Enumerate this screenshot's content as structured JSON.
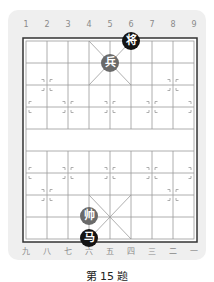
{
  "board": {
    "top_file_labels": [
      "1",
      "2",
      "3",
      "4",
      "5",
      "6",
      "7",
      "8",
      "9"
    ],
    "bottom_file_labels": [
      "九",
      "八",
      "七",
      "六",
      "五",
      "四",
      "三",
      "二",
      "一"
    ],
    "colors": {
      "panel": "#efefef",
      "board_bg": "#ffffff",
      "grid": "#9a9a9a",
      "border": "#333333",
      "black_piece": "#141414",
      "red_piece": "#6a6a6a"
    },
    "pieces": [
      {
        "name": "black-general",
        "label": "将",
        "side": "black",
        "file": 6,
        "rank": 1
      },
      {
        "name": "red-soldier",
        "label": "兵",
        "side": "gray",
        "file": 5,
        "rank": 2
      },
      {
        "name": "red-general",
        "label": "帅",
        "side": "gray",
        "file": 4,
        "rank": 9
      },
      {
        "name": "black-horse",
        "label": "马",
        "side": "black",
        "file": 4,
        "rank": 10
      }
    ]
  },
  "caption": "第 15 题"
}
